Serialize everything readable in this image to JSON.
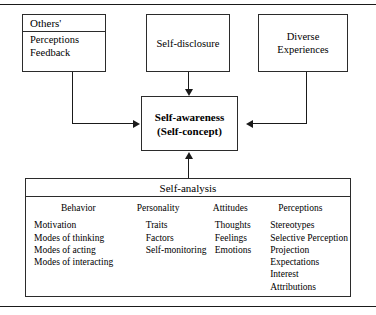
{
  "figure": {
    "rules": {
      "top": "horizontal-rule",
      "bottom": "horizontal-rule"
    }
  },
  "boxes": {
    "others": {
      "header": "Others'",
      "items": [
        "Perceptions",
        "Feedback"
      ]
    },
    "self_disclosure": {
      "label": "Self-disclosure"
    },
    "diverse_experiences": {
      "line1": "Diverse",
      "line2": "Experiences"
    },
    "self_awareness": {
      "line1": "Self-awareness",
      "line2": "(Self-concept)"
    },
    "self_analysis": {
      "header": "Self-analysis",
      "columns": [
        {
          "title": "Behavior",
          "items": [
            "Motivation",
            "Modes of thinking",
            "Modes of acting",
            "Modes of interacting"
          ]
        },
        {
          "title": "Personality",
          "items": [
            "Traits",
            "Factors",
            "Self-monitoring"
          ]
        },
        {
          "title": "Attitudes",
          "items": [
            "Thoughts",
            "Feelings",
            "Emotions"
          ]
        },
        {
          "title": "Perceptions",
          "items": [
            "Stereotypes",
            "Selective Perception",
            "Projection",
            "Expectations",
            "Interest",
            "Attributions"
          ]
        }
      ]
    }
  },
  "connectors": [
    {
      "name": "others-to-self-awareness",
      "from": "others",
      "to": "self_awareness",
      "direction": "right"
    },
    {
      "name": "self-disclosure-to-self-awareness",
      "from": "self_disclosure",
      "to": "self_awareness",
      "direction": "down"
    },
    {
      "name": "diverse-experiences-to-self-awareness",
      "from": "diverse_experiences",
      "to": "self_awareness",
      "direction": "left"
    },
    {
      "name": "self-analysis-to-self-awareness",
      "from": "self_analysis",
      "to": "self_awareness",
      "direction": "up"
    }
  ],
  "colors": {
    "line": "#1a1a1a",
    "border": "#2b2b2b",
    "background": "#ffffff",
    "text": "#000000"
  }
}
